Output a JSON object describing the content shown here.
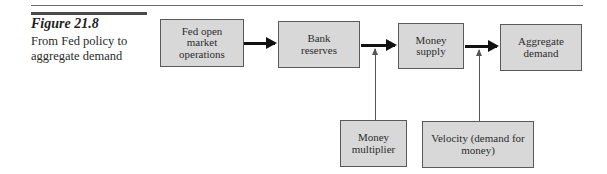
{
  "figure": {
    "label": "Figure 21.8",
    "caption": "From Fed policy to aggregate demand"
  },
  "diagram": {
    "nodes": [
      {
        "id": "fed-open-market-operations",
        "label": "Fed open market operations"
      },
      {
        "id": "bank-reserves",
        "label": "Bank reserves"
      },
      {
        "id": "money-supply",
        "label": "Money supply"
      },
      {
        "id": "aggregate-demand",
        "label": "Aggregate demand"
      },
      {
        "id": "money-multiplier",
        "label": "Money multiplier"
      },
      {
        "id": "velocity",
        "label": "Velocity (demand for money)"
      }
    ],
    "edges": [
      {
        "from": "fed-open-market-operations",
        "to": "bank-reserves",
        "style": "thick"
      },
      {
        "from": "bank-reserves",
        "to": "money-supply",
        "style": "thick"
      },
      {
        "from": "money-supply",
        "to": "aggregate-demand",
        "style": "thick"
      },
      {
        "from": "money-multiplier",
        "to": "bank-reserves->money-supply",
        "style": "thin"
      },
      {
        "from": "velocity",
        "to": "money-supply->aggregate-demand",
        "style": "thin"
      }
    ]
  }
}
